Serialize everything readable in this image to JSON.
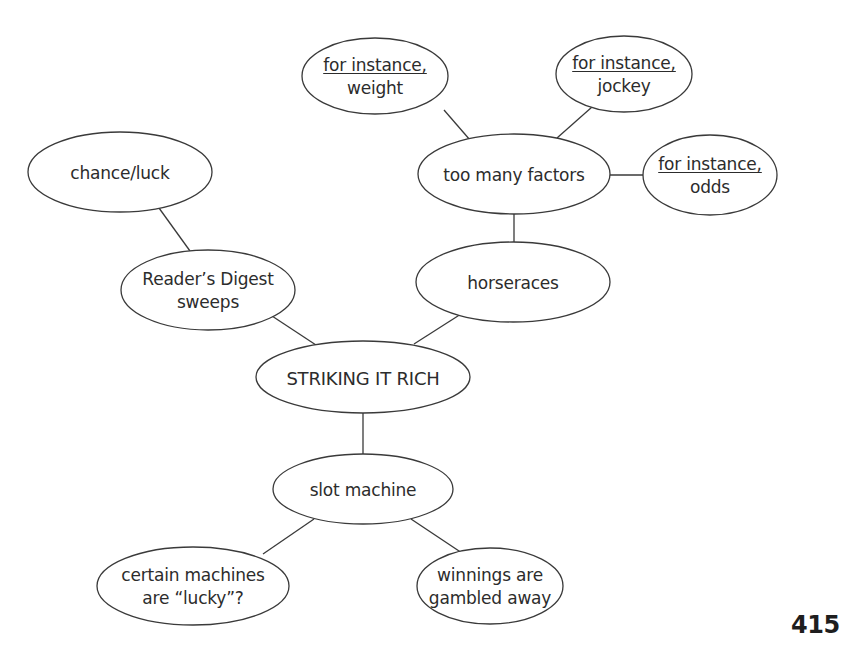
{
  "diagram": {
    "type": "concept-web",
    "root": "STRIKING IT RICH",
    "nodes": [
      {
        "id": "striking",
        "lines": [
          "STRIKING IT RICH"
        ],
        "underline_first": false,
        "cx": 363,
        "cy": 377,
        "rx": 107,
        "ry": 36
      },
      {
        "id": "readers",
        "lines": [
          "Reader’s Digest",
          "sweeps"
        ],
        "underline_first": false,
        "cx": 208,
        "cy": 290,
        "rx": 87,
        "ry": 40
      },
      {
        "id": "chance",
        "lines": [
          "chance/luck"
        ],
        "underline_first": false,
        "cx": 120,
        "cy": 172,
        "rx": 92,
        "ry": 40
      },
      {
        "id": "horseraces",
        "lines": [
          "horseraces"
        ],
        "underline_first": false,
        "cx": 513,
        "cy": 282,
        "rx": 97,
        "ry": 40
      },
      {
        "id": "factors",
        "lines": [
          "too many factors"
        ],
        "underline_first": false,
        "cx": 514,
        "cy": 174,
        "rx": 96,
        "ry": 40
      },
      {
        "id": "weight",
        "lines": [
          "for instance,",
          "weight"
        ],
        "underline_first": true,
        "cx": 375,
        "cy": 76,
        "rx": 73,
        "ry": 38
      },
      {
        "id": "jockey",
        "lines": [
          "for instance,",
          "jockey"
        ],
        "underline_first": true,
        "cx": 624,
        "cy": 74,
        "rx": 68,
        "ry": 38
      },
      {
        "id": "odds",
        "lines": [
          "for instance,",
          "odds"
        ],
        "underline_first": true,
        "cx": 710,
        "cy": 175,
        "rx": 67,
        "ry": 40
      },
      {
        "id": "slot",
        "lines": [
          "slot machine"
        ],
        "underline_first": false,
        "cx": 363,
        "cy": 489,
        "rx": 90,
        "ry": 35
      },
      {
        "id": "lucky",
        "lines": [
          "certain machines",
          "are “lucky”?"
        ],
        "underline_first": false,
        "cx": 193,
        "cy": 586,
        "rx": 96,
        "ry": 39
      },
      {
        "id": "winnings",
        "lines": [
          "winnings are",
          "gambled away"
        ],
        "underline_first": false,
        "cx": 490,
        "cy": 586,
        "rx": 73,
        "ry": 38
      }
    ],
    "edges": [
      {
        "from": "striking",
        "to": "readers",
        "x1": 316,
        "y1": 345,
        "x2": 272,
        "y2": 316
      },
      {
        "from": "striking",
        "to": "horseraces",
        "x1": 414,
        "y1": 344,
        "x2": 461,
        "y2": 314
      },
      {
        "from": "striking",
        "to": "slot",
        "x1": 363,
        "y1": 413,
        "x2": 363,
        "y2": 454
      },
      {
        "from": "readers",
        "to": "chance",
        "x1": 190,
        "y1": 251,
        "x2": 159,
        "y2": 208
      },
      {
        "from": "horseraces",
        "to": "factors",
        "x1": 514,
        "y1": 242,
        "x2": 514,
        "y2": 214
      },
      {
        "from": "factors",
        "to": "weight",
        "x1": 470,
        "y1": 140,
        "x2": 444,
        "y2": 110
      },
      {
        "from": "factors",
        "to": "jockey",
        "x1": 557,
        "y1": 138,
        "x2": 592,
        "y2": 107
      },
      {
        "from": "factors",
        "to": "odds",
        "x1": 610,
        "y1": 175,
        "x2": 643,
        "y2": 175
      },
      {
        "from": "slot",
        "to": "lucky",
        "x1": 314,
        "y1": 519,
        "x2": 263,
        "y2": 554
      },
      {
        "from": "slot",
        "to": "winnings",
        "x1": 411,
        "y1": 519,
        "x2": 462,
        "y2": 553
      }
    ]
  },
  "footer": {
    "page_number": "415"
  }
}
